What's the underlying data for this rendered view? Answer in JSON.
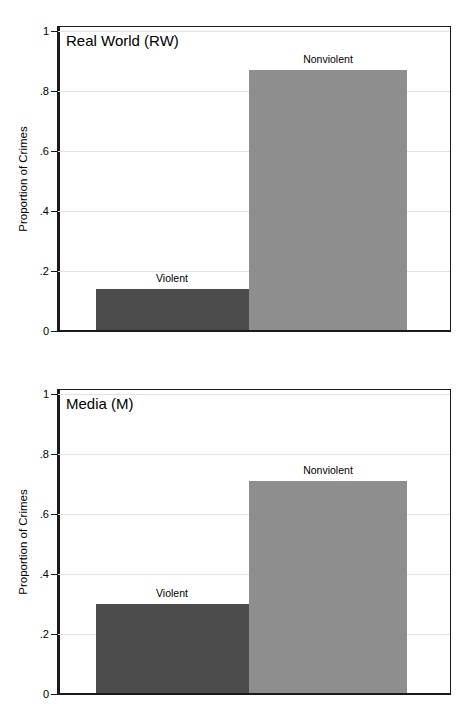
{
  "figure": {
    "width": 467,
    "height": 726,
    "background": "#ffffff",
    "colors": {
      "violent_bar": "#4c4c4c",
      "nonviolent_bar": "#8e8e8e",
      "axis": "#1a1a1a",
      "gridline": "#e2e2e2",
      "text": "#000000"
    }
  },
  "panels": [
    {
      "id": "real-world",
      "title": "Real World (RW)",
      "ylabel": "Proportion of Crimes",
      "ytick_labels": [
        "1",
        ".8",
        ".6",
        ".4",
        ".2",
        "0"
      ],
      "bars": [
        {
          "label": "Violent",
          "value": 0.14
        },
        {
          "label": "Nonviolent",
          "value": 0.87
        }
      ]
    },
    {
      "id": "media",
      "title": "Media (M)",
      "ylabel": "Proportion of Crimes",
      "ytick_labels": [
        "1",
        ".8",
        ".6",
        ".4",
        ".2",
        "0"
      ],
      "bars": [
        {
          "label": "Violent",
          "value": 0.3
        },
        {
          "label": "Nonviolent",
          "value": 0.71
        }
      ]
    }
  ],
  "chart_data": [
    {
      "type": "bar",
      "title": "Real World (RW)",
      "categories": [
        "Violent",
        "Nonviolent"
      ],
      "values": [
        0.14,
        0.87
      ],
      "xlabel": "",
      "ylabel": "Proportion of Crimes",
      "ylim": [
        0,
        1
      ],
      "yticks": [
        0,
        0.2,
        0.4,
        0.6,
        0.8,
        1
      ],
      "ytick_labels": [
        "0",
        ".2",
        ".4",
        ".6",
        ".8",
        "1"
      ],
      "grid": true,
      "legend": "none",
      "annotations": [
        "Violent",
        "Nonviolent"
      ],
      "bar_colors": [
        "#4c4c4c",
        "#8e8e8e"
      ]
    },
    {
      "type": "bar",
      "title": "Media (M)",
      "categories": [
        "Violent",
        "Nonviolent"
      ],
      "values": [
        0.3,
        0.71
      ],
      "xlabel": "",
      "ylabel": "Proportion of Crimes",
      "ylim": [
        0,
        1
      ],
      "yticks": [
        0,
        0.2,
        0.4,
        0.6,
        0.8,
        1
      ],
      "ytick_labels": [
        "0",
        ".2",
        ".4",
        ".6",
        ".8",
        "1"
      ],
      "grid": true,
      "legend": "none",
      "annotations": [
        "Violent",
        "Nonviolent"
      ],
      "bar_colors": [
        "#4c4c4c",
        "#8e8e8e"
      ]
    }
  ]
}
